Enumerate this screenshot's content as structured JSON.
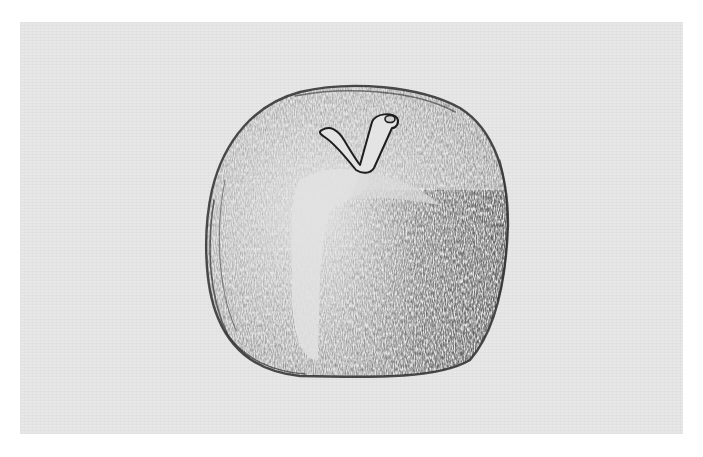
{
  "artwork": {
    "subject": "Pencil sketch of an apple with stem",
    "medium": "graphite on textured paper",
    "colors": {
      "page_background": "#ffffff",
      "paper": "#e7e7e7",
      "graphite_dark": "#2a2a2a",
      "graphite_mid": "#6e6e6e",
      "graphite_light": "#a8a8a8",
      "highlight": "#dedede"
    }
  }
}
